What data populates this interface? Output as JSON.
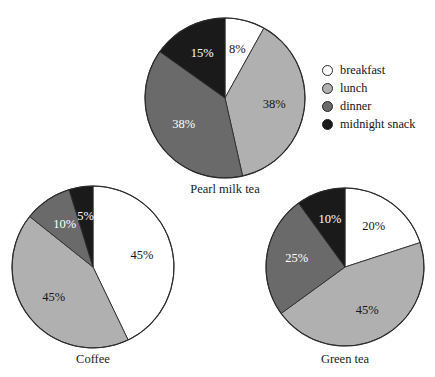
{
  "figure": {
    "cropped_title_remnant": "pp",
    "legend": {
      "position": "right",
      "items": [
        {
          "label": "breakfast",
          "swatch": "circle-outline-icon",
          "color": "#ffffff"
        },
        {
          "label": "lunch",
          "swatch": "circle-filled-icon",
          "color": "#b0b0b0"
        },
        {
          "label": "dinner",
          "swatch": "circle-filled-icon",
          "color": "#6a6a6a"
        },
        {
          "label": "midnight snack",
          "swatch": "circle-filled-icon",
          "color": "#1a1a1a"
        }
      ]
    }
  },
  "chart_data": [
    {
      "type": "pie",
      "title": "Pearl milk tea",
      "categories": [
        "breakfast",
        "lunch",
        "dinner",
        "midnight snack"
      ],
      "values": [
        8,
        38,
        38,
        15
      ],
      "labels": [
        "8%",
        "38%",
        "38%",
        "15%"
      ],
      "colors": [
        "#ffffff",
        "#b0b0b0",
        "#6a6a6a",
        "#1a1a1a"
      ],
      "label_colors": [
        "dark",
        "dark",
        "light",
        "light"
      ],
      "start_angle_deg": 0,
      "direction": "clockwise",
      "units": "percent"
    },
    {
      "type": "pie",
      "title": "Coffee",
      "categories": [
        "breakfast",
        "lunch",
        "dinner",
        "midnight snack"
      ],
      "values": [
        45,
        45,
        10,
        5
      ],
      "labels": [
        "45%",
        "45%",
        "10%",
        "5%"
      ],
      "colors": [
        "#ffffff",
        "#b0b0b0",
        "#6a6a6a",
        "#1a1a1a"
      ],
      "label_colors": [
        "dark",
        "dark",
        "light",
        "light"
      ],
      "start_angle_deg": 0,
      "direction": "clockwise",
      "units": "percent"
    },
    {
      "type": "pie",
      "title": "Green tea",
      "categories": [
        "breakfast",
        "lunch",
        "dinner",
        "midnight snack"
      ],
      "values": [
        20,
        45,
        25,
        10
      ],
      "labels": [
        "20%",
        "45%",
        "25%",
        "10%"
      ],
      "colors": [
        "#ffffff",
        "#b0b0b0",
        "#6a6a6a",
        "#1a1a1a"
      ],
      "label_colors": [
        "dark",
        "dark",
        "light",
        "light"
      ],
      "start_angle_deg": 0,
      "direction": "clockwise",
      "units": "percent"
    }
  ],
  "layout": {
    "pies": [
      {
        "cx": 225,
        "cy": 98,
        "r": 80,
        "title_y": 182,
        "label_radius_factor": 0.62
      },
      {
        "cx": 93,
        "cy": 267,
        "r": 81,
        "title_y": 352,
        "label_radius_factor": 0.62
      },
      {
        "cx": 345,
        "cy": 267,
        "r": 79,
        "title_y": 352,
        "label_radius_factor": 0.62
      }
    ]
  }
}
